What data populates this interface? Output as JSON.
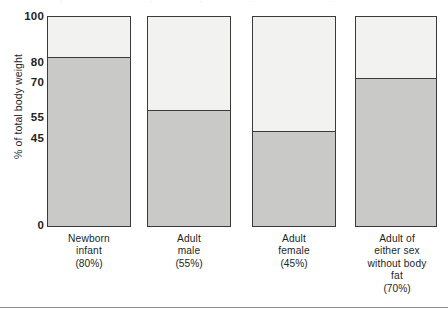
{
  "chart_data": {
    "type": "bar",
    "stacked": true,
    "title": "",
    "subtitle": "",
    "xlabel": "",
    "ylabel": "% of total body weight",
    "ylim": [
      0,
      100
    ],
    "grid": false,
    "legend": null,
    "categories": [
      "Newborn infant",
      "Adult male",
      "Adult female",
      "Adult of either sex without body fat"
    ],
    "category_lines": [
      [
        "Newborn",
        "infant",
        "(80%)"
      ],
      [
        "Adult",
        "male",
        "(55%)"
      ],
      [
        "Adult",
        "female",
        "(45%)"
      ],
      [
        "Adult of",
        "either sex",
        "without body",
        "fat",
        "(70%)"
      ]
    ],
    "series": [
      {
        "name": "Body water",
        "color": "#c9c9c7",
        "values": [
          80,
          55,
          45,
          70
        ]
      },
      {
        "name": "Remainder of body weight",
        "color": "#f2f2f0",
        "values": [
          20,
          45,
          55,
          30
        ]
      }
    ],
    "ytick_values": [
      0,
      45,
      55,
      70,
      80,
      100
    ],
    "ytick_labels": [
      "0",
      "45",
      "55",
      "70",
      "80",
      "100"
    ],
    "annotations": []
  },
  "axis": {
    "y_label": "% of total body weight",
    "ticks": [
      {
        "label": "100",
        "value": 100
      },
      {
        "label": "80",
        "value": 80
      },
      {
        "label": "70",
        "value": 70
      },
      {
        "label": "55",
        "value": 55
      },
      {
        "label": "45",
        "value": 45
      },
      {
        "label": "0",
        "value": 0
      }
    ]
  },
  "bars": [
    {
      "id": "newborn-infant",
      "water_pct": 80,
      "lines": [
        "Newborn",
        "infant",
        "(80%)"
      ]
    },
    {
      "id": "adult-male",
      "water_pct": 55,
      "lines": [
        "Adult",
        "male",
        "(55%)"
      ]
    },
    {
      "id": "adult-female",
      "water_pct": 45,
      "lines": [
        "Adult",
        "female",
        "(45%)"
      ]
    },
    {
      "id": "adult-without-body-fat",
      "water_pct": 70,
      "lines": [
        "Adult of",
        "either sex",
        "without body",
        "fat",
        "(70%)"
      ]
    }
  ],
  "colors": {
    "water_fill": "#c9c9c7",
    "upper_fill": "#f2f2f0",
    "outline": "#3a3a3a",
    "text": "#221f1f",
    "rule": "#8e8e8e"
  }
}
